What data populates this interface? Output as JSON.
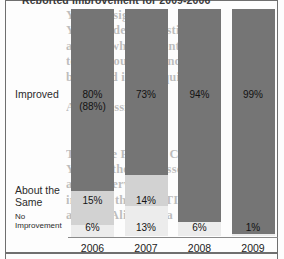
{
  "chart_title": "Reported Improvement for 2009-2006",
  "row_labels": {
    "improved": "Improved",
    "about_the_same": "About the\nSame",
    "no_improvement": "No\nImprovement"
  },
  "colors": {
    "improved": "#757575",
    "about_the_same": "#d2d2d2",
    "no_improvement": "#ececec",
    "axis": "#8a8a8a",
    "frame": "#6f6f6f",
    "text": "#1f1f1f",
    "page_background": "#fdfdfd"
  },
  "bleed_text": "Your  Assignment\nYou decide to investigate\nand see what it identifies\nto carry out your indicated\nbank and issue inquiry\n\nA few possible\n\n\nThe Case PTI and Con\nYou are the plan associate\nadd oil services co\nimprove the use PTI\nand the Align-to Pa",
  "chart_data": {
    "type": "bar",
    "subtype": "stacked-100-percent",
    "title": "Reported Improvement for 2009-2006",
    "xlabel": "",
    "ylabel": "",
    "ylim": [
      0,
      100
    ],
    "grid": false,
    "legend_position": "left-row-labels",
    "categories": [
      "2006",
      "2007",
      "2008",
      "2009"
    ],
    "series": [
      {
        "name": "Improved",
        "color": "#757575",
        "values": [
          80,
          73,
          94,
          99
        ],
        "labels": [
          "80%",
          "73%",
          "94%",
          "99%"
        ],
        "secondary_labels": [
          "(88%)",
          "",
          "",
          ""
        ]
      },
      {
        "name": "About the Same",
        "color": "#d2d2d2",
        "values": [
          15,
          14,
          0,
          0
        ],
        "labels": [
          "15%",
          "14%",
          "",
          ""
        ]
      },
      {
        "name": "No Improvement",
        "color": "#ececec",
        "values": [
          6,
          13,
          6,
          1
        ],
        "labels": [
          "6%",
          "13%",
          "6%",
          "1%"
        ]
      }
    ]
  },
  "bars": [
    {
      "year": "2006",
      "improved_label": "80%",
      "improved_sub_label": "(88%)",
      "same_label": "15%",
      "none_label": "6%",
      "improved_pct": 80,
      "same_pct": 15,
      "none_pct": 6
    },
    {
      "year": "2007",
      "improved_label": "73%",
      "improved_sub_label": "",
      "same_label": "14%",
      "none_label": "13%",
      "improved_pct": 73,
      "same_pct": 14,
      "none_pct": 13
    },
    {
      "year": "2008",
      "improved_label": "94%",
      "improved_sub_label": "",
      "same_label": "",
      "none_label": "6%",
      "improved_pct": 94,
      "same_pct": 0,
      "none_pct": 6
    },
    {
      "year": "2009",
      "improved_label": "99%",
      "improved_sub_label": "",
      "same_label": "",
      "none_label": "1%",
      "improved_pct": 99,
      "same_pct": 0,
      "none_pct": 1
    }
  ]
}
